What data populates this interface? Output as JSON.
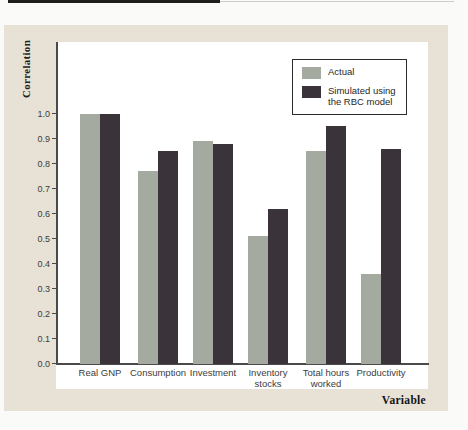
{
  "colors": {
    "panel_background": "#e7e2d5",
    "plot_background": "#ffffff",
    "axis": "#4a4a4a",
    "top_rule_dark": "#1e1e1e",
    "top_rule_light": "#cccdc7",
    "actual_bar": "#a5aaa1",
    "simulated_bar": "#3a343a"
  },
  "chart_data": {
    "type": "bar",
    "title": "",
    "xlabel": "Variable",
    "ylabel": "Correlation",
    "categories": [
      "Real GNP",
      "Consumption",
      "Investment",
      "Inventory stocks",
      "Total hours worked",
      "Productivity"
    ],
    "series": [
      {
        "name": "Actual",
        "color": "#a5aaa1",
        "values": [
          1.0,
          0.77,
          0.89,
          0.51,
          0.85,
          0.36
        ]
      },
      {
        "name": "Simulated using the RBC model",
        "color": "#3a343a",
        "values": [
          1.0,
          0.85,
          0.88,
          0.62,
          0.95,
          0.86
        ]
      }
    ],
    "ylim": [
      0.0,
      1.0
    ],
    "yticks": [
      0.0,
      0.1,
      0.2,
      0.3,
      0.4,
      0.5,
      0.6,
      0.7,
      0.8,
      0.9,
      1.0
    ],
    "grid": false,
    "legend_position": "upper-right-inside"
  }
}
